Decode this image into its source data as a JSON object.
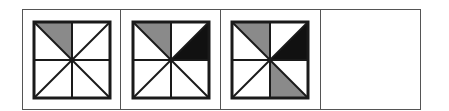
{
  "figure": {
    "panel_count": 4,
    "colors": {
      "gray": "#8a8a8a",
      "black": "#111111",
      "white": "#ffffff",
      "stroke": "#1a1a1a",
      "frame": "#555555"
    },
    "triangle_order": [
      "top-left",
      "top-right",
      "right-upper",
      "right-lower",
      "bottom-right",
      "bottom-left",
      "left-lower",
      "left-upper"
    ],
    "panels": [
      {
        "id": 1,
        "shaded": {
          "top-left": "gray"
        }
      },
      {
        "id": 2,
        "shaded": {
          "top-left": "gray",
          "right-upper": "black"
        }
      },
      {
        "id": 3,
        "shaded": {
          "top-left": "gray",
          "right-upper": "black",
          "bottom-right": "gray"
        }
      },
      {
        "id": 4,
        "shaded": {},
        "blank": true
      }
    ]
  }
}
